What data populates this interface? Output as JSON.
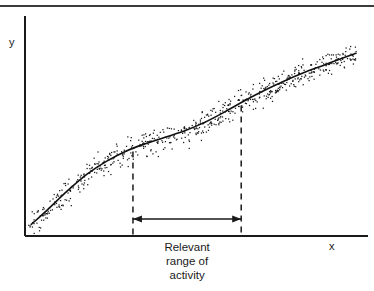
{
  "figure": {
    "has_top_rule": true,
    "background_color": "#ffffff",
    "ink_color": "#1a1a1a"
  },
  "axes": {
    "y_label": "y",
    "x_label": "x"
  },
  "annotation": {
    "caption_line1": "Relevant",
    "caption_line2": "range of",
    "caption_line3": "activity",
    "arrow_name": "double-headed-arrow"
  },
  "chart_data": {
    "type": "scatter",
    "title": "",
    "subtitle": "",
    "xlabel": "x",
    "ylabel": "y",
    "xlim": [
      0,
      100
    ],
    "ylim": [
      0,
      100
    ],
    "grid": false,
    "legend": null,
    "legend_position": "none",
    "axis_style": "open-left-bottom",
    "tick_labels": {
      "x": [],
      "y": []
    },
    "series": [
      {
        "name": "fitted curve",
        "type": "line",
        "points": [
          [
            1.0,
            3.0
          ],
          [
            6.0,
            11.0
          ],
          [
            12.0,
            21.0
          ],
          [
            18.0,
            30.0
          ],
          [
            24.0,
            37.0
          ],
          [
            30.0,
            42.5
          ],
          [
            36.0,
            46.5
          ],
          [
            42.0,
            50.0
          ],
          [
            48.0,
            53.5
          ],
          [
            54.0,
            58.0
          ],
          [
            60.0,
            63.5
          ],
          [
            66.0,
            69.5
          ],
          [
            72.0,
            75.0
          ],
          [
            78.0,
            80.0
          ],
          [
            84.0,
            84.5
          ],
          [
            90.0,
            88.5
          ],
          [
            96.0,
            92.5
          ],
          [
            100.0,
            95.0
          ]
        ]
      },
      {
        "name": "observations",
        "type": "scatter",
        "point_count": 620,
        "band_half_width": 7.0,
        "marker": "dot",
        "marker_size_px": 1,
        "note": "Points scattered in a band of roughly constant vertical width about the fitted curve across the full x range."
      }
    ],
    "annotations": [
      {
        "name": "relevant-range",
        "kind": "span",
        "x_start": 32.0,
        "x_end": 65.0,
        "label": "Relevant range of activity",
        "marker": "double-headed-arrow",
        "boundaries": "vertical dashed lines from curve down to x-axis"
      }
    ]
  }
}
